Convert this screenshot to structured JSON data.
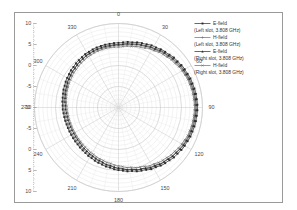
{
  "figure": {
    "background": "#ffffff",
    "frame_color": "#9a9a9a"
  },
  "legend": {
    "entries": [
      {
        "marker": "filled-square-marker",
        "label": "E-field",
        "sublabel": "(Left slot, 3.808 GHz)",
        "color": "#2a2a2a"
      },
      {
        "marker": "plus-marker",
        "label": "H-field",
        "sublabel": "(Left slot, 3.808 GHz)",
        "color": "#6e6e6e"
      },
      {
        "marker": "filled-triangle-marker",
        "label": "E-field",
        "sublabel": "(Right slot, 3.808 GHz)",
        "color": "#2a2a2a"
      },
      {
        "marker": "cross-marker",
        "label": "H-field",
        "sublabel": "(Right slot, 3.808 GHz)",
        "color": "#6e6e6e"
      }
    ]
  },
  "chart_data": {
    "type": "line",
    "plot_kind": "polar-radiation-pattern",
    "title": "",
    "xlabel": "",
    "ylabel": "",
    "angular_unit": "degrees",
    "angular_labels": [
      "0",
      "30",
      "60",
      "90",
      "120",
      "150",
      "180",
      "210",
      "240",
      "270",
      "300",
      "330"
    ],
    "angular_tick_step": 30,
    "angular_start_at_top": true,
    "angular_direction": "clockwise",
    "radial_axis_labels": [
      "10",
      "5",
      "0",
      "-5",
      "-10",
      "-5",
      "0",
      "5",
      "10"
    ],
    "radial_ticks_db": [
      10,
      5,
      0,
      -5,
      -10
    ],
    "rlim": [
      -10,
      10
    ],
    "radial_unit": "dB",
    "grid": true,
    "legend_position": "right",
    "series": [
      {
        "name": "E-field (Left slot, 3.808 GHz)",
        "color": "#2a2a2a",
        "marker": "filled-square-marker",
        "angles": [
          0,
          10,
          20,
          30,
          40,
          50,
          60,
          70,
          80,
          90,
          100,
          110,
          120,
          130,
          140,
          150,
          160,
          170,
          180,
          190,
          200,
          210,
          220,
          230,
          240,
          250,
          260,
          270,
          280,
          290,
          300,
          310,
          320,
          330,
          340,
          350
        ],
        "values": [
          5.4,
          5.8,
          6.3,
          6.8,
          7.3,
          7.8,
          8.2,
          8.5,
          8.7,
          8.8,
          8.7,
          8.5,
          8.2,
          7.8,
          7.3,
          6.7,
          6.0,
          5.4,
          4.9,
          4.4,
          4.0,
          3.6,
          3.3,
          3.1,
          3.0,
          3.0,
          3.1,
          3.3,
          3.5,
          3.8,
          4.1,
          4.4,
          4.7,
          5.0,
          5.2,
          5.3
        ]
      },
      {
        "name": "H-field (Left slot, 3.808 GHz)",
        "color": "#6e6e6e",
        "marker": "plus-marker",
        "angles": [
          0,
          10,
          20,
          30,
          40,
          50,
          60,
          70,
          80,
          90,
          100,
          110,
          120,
          130,
          140,
          150,
          160,
          170,
          180,
          190,
          200,
          210,
          220,
          230,
          240,
          250,
          260,
          270,
          280,
          290,
          300,
          310,
          320,
          330,
          340,
          350
        ],
        "values": [
          4.8,
          5.2,
          5.7,
          6.2,
          6.8,
          7.3,
          7.7,
          8.0,
          8.2,
          8.3,
          8.2,
          8.0,
          7.7,
          7.3,
          6.8,
          6.2,
          5.6,
          5.0,
          4.5,
          4.0,
          3.6,
          3.2,
          3.0,
          2.8,
          2.7,
          2.7,
          2.8,
          3.0,
          3.2,
          3.4,
          3.7,
          4.0,
          4.2,
          4.5,
          4.6,
          4.7
        ]
      },
      {
        "name": "E-field (Right slot, 3.808 GHz)",
        "color": "#2a2a2a",
        "marker": "filled-triangle-marker",
        "angles": [
          0,
          10,
          20,
          30,
          40,
          50,
          60,
          70,
          80,
          90,
          100,
          110,
          120,
          130,
          140,
          150,
          160,
          170,
          180,
          190,
          200,
          210,
          220,
          230,
          240,
          250,
          260,
          270,
          280,
          290,
          300,
          310,
          320,
          330,
          340,
          350
        ],
        "values": [
          5.0,
          5.4,
          5.9,
          6.4,
          7.0,
          7.5,
          7.9,
          8.2,
          8.4,
          8.5,
          8.4,
          8.2,
          7.9,
          7.4,
          6.9,
          6.3,
          5.6,
          5.0,
          4.4,
          3.9,
          3.4,
          3.0,
          2.7,
          2.4,
          2.3,
          2.3,
          2.4,
          2.6,
          2.9,
          3.2,
          3.6,
          3.9,
          4.3,
          4.6,
          4.8,
          4.9
        ]
      },
      {
        "name": "H-field (Right slot, 3.808 GHz)",
        "color": "#6e6e6e",
        "marker": "cross-marker",
        "angles": [
          0,
          10,
          20,
          30,
          40,
          50,
          60,
          70,
          80,
          90,
          100,
          110,
          120,
          130,
          140,
          150,
          160,
          170,
          180,
          190,
          200,
          210,
          220,
          230,
          240,
          250,
          260,
          270,
          280,
          290,
          300,
          310,
          320,
          330,
          340,
          350
        ],
        "values": [
          4.4,
          4.8,
          5.3,
          5.9,
          6.5,
          7.0,
          7.5,
          7.8,
          8.0,
          8.1,
          8.0,
          7.8,
          7.4,
          6.9,
          6.4,
          5.8,
          5.1,
          4.5,
          3.9,
          3.4,
          3.0,
          2.6,
          2.3,
          2.1,
          2.0,
          2.0,
          2.1,
          2.3,
          2.6,
          2.9,
          3.2,
          3.5,
          3.8,
          4.1,
          4.3,
          4.4
        ]
      }
    ]
  }
}
